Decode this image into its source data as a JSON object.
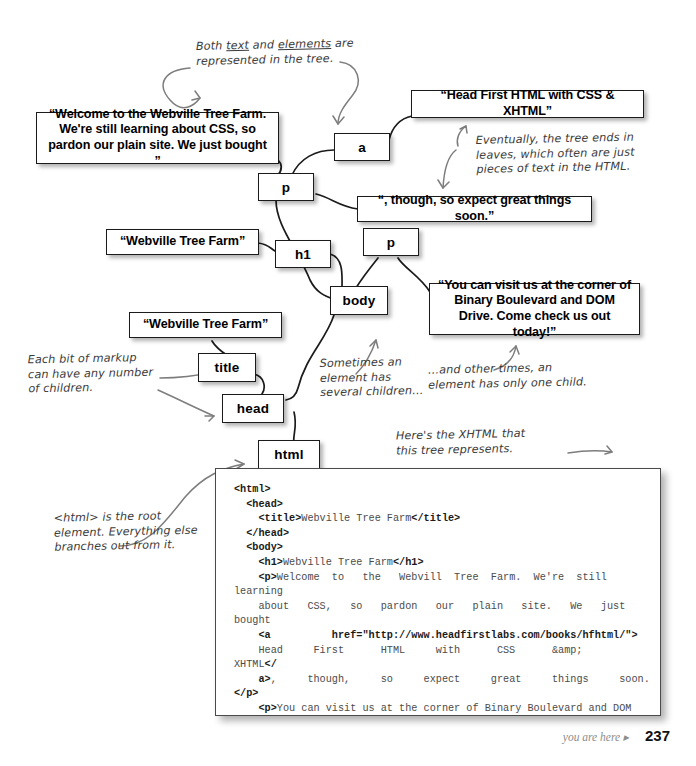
{
  "page": {
    "footer_note": "you are here",
    "footer_arrow": "▸",
    "page_number": "237"
  },
  "tree": {
    "nodes": [
      {
        "id": "a",
        "label": "a"
      },
      {
        "id": "p1",
        "label": "p"
      },
      {
        "id": "h1",
        "label": "h1"
      },
      {
        "id": "p2",
        "label": "p"
      },
      {
        "id": "body",
        "label": "body"
      },
      {
        "id": "title",
        "label": "title"
      },
      {
        "id": "head",
        "label": "head"
      },
      {
        "id": "html",
        "label": "html"
      }
    ],
    "text_nodes": [
      {
        "id": "welcome",
        "text": "“Welcome to the Webville Tree Farm. We're still learning about CSS, so pardon our plain site. We just bought ”"
      },
      {
        "id": "anchor-text",
        "text": "“Head First HTML with CSS & XHTML”"
      },
      {
        "id": "though",
        "text": "“, though, so expect great things soon.”"
      },
      {
        "id": "h1-text",
        "text": "“Webville Tree Farm”"
      },
      {
        "id": "title-text",
        "text": "“Webville Tree Farm”"
      },
      {
        "id": "visit",
        "text": "“You can visit us at the corner of Binary Boulevard and DOM Drive. Come check us out today!”"
      }
    ]
  },
  "annotations": {
    "both_text_elements": "Both text and elements are represented in the tree.",
    "eventually_leaves": "Eventually, the tree ends in leaves, which often are just pieces of text in the HTML.",
    "each_bit_markup": "Each bit of markup can have any number of children.",
    "sometimes_several": "Sometimes an element has several children…",
    "other_times_one": "…and other times, an element has only one child.",
    "heres_the_xhtml": "Here's the XHTML that this tree represents.",
    "html_root": "<html> is the root element. Everything else branches out from it."
  },
  "code": {
    "lines": [
      {
        "segments": [
          {
            "t": "<html>",
            "bold": true
          }
        ],
        "indent": 0
      },
      {
        "segments": [
          {
            "t": "<head>",
            "bold": true
          }
        ],
        "indent": 1
      },
      {
        "segments": [
          {
            "t": "<title>",
            "bold": true
          },
          {
            "t": "Webville Tree Farm",
            "bold": false
          },
          {
            "t": "</title>",
            "bold": true
          }
        ],
        "indent": 2
      },
      {
        "segments": [
          {
            "t": "</head>",
            "bold": true
          }
        ],
        "indent": 1
      },
      {
        "segments": [
          {
            "t": "<body>",
            "bold": true
          }
        ],
        "indent": 1
      },
      {
        "segments": [
          {
            "t": "<h1>",
            "bold": true
          },
          {
            "t": "Webville Tree Farm",
            "bold": false
          },
          {
            "t": "</h1>",
            "bold": true
          }
        ],
        "indent": 2
      },
      {
        "segments": [
          {
            "t": "<p>",
            "bold": true
          },
          {
            "t": "Welcome  to   the   Webvill  Tree  Farm.  We're  still  learning",
            "bold": false
          }
        ],
        "indent": 2
      },
      {
        "segments": [
          {
            "t": "about   CSS,   so   pardon   our   plain   site.   We   just   bought",
            "bold": false
          }
        ],
        "indent": 2
      },
      {
        "segments": [
          {
            "t": "<a",
            "bold": true
          },
          {
            "t": "          ",
            "bold": false
          },
          {
            "t": "href=\"http://www.headfirstlabs.com/books/hfhtml/\">",
            "bold": true
          }
        ],
        "indent": 2
      },
      {
        "segments": [
          {
            "t": "Head     First      HTML     with      CSS      &amp;      XHTML",
            "bold": false
          },
          {
            "t": "</",
            "bold": true
          }
        ],
        "indent": 2
      },
      {
        "segments": [
          {
            "t": "a>",
            "bold": true
          },
          {
            "t": ",     though,     so     expect     great     things     soon.",
            "bold": false
          },
          {
            "t": "</p>",
            "bold": true
          }
        ],
        "indent": 2
      },
      {
        "segments": [
          {
            "t": "<p>",
            "bold": true
          },
          {
            "t": "You can visit us at the corner of Binary Boulevard and DOM",
            "bold": false
          }
        ],
        "indent": 2
      },
      {
        "segments": [
          {
            "t": "Drive. Come check us out today!",
            "bold": false
          },
          {
            "t": "</>",
            "bold": true
          }
        ],
        "indent": 2
      },
      {
        "segments": [
          {
            "t": "",
            "bold": false
          }
        ],
        "indent": 0
      },
      {
        "segments": [
          {
            "t": "</body>",
            "bold": true
          }
        ],
        "indent": 1
      },
      {
        "segments": [
          {
            "t": "</html>",
            "bold": true
          }
        ],
        "indent": 0
      }
    ]
  },
  "colors": {
    "ink": "#1b1b1b",
    "pencil": "#3b3b3b",
    "code_plain": "#4b4b4b",
    "footer_gray": "#8d8d8d"
  }
}
